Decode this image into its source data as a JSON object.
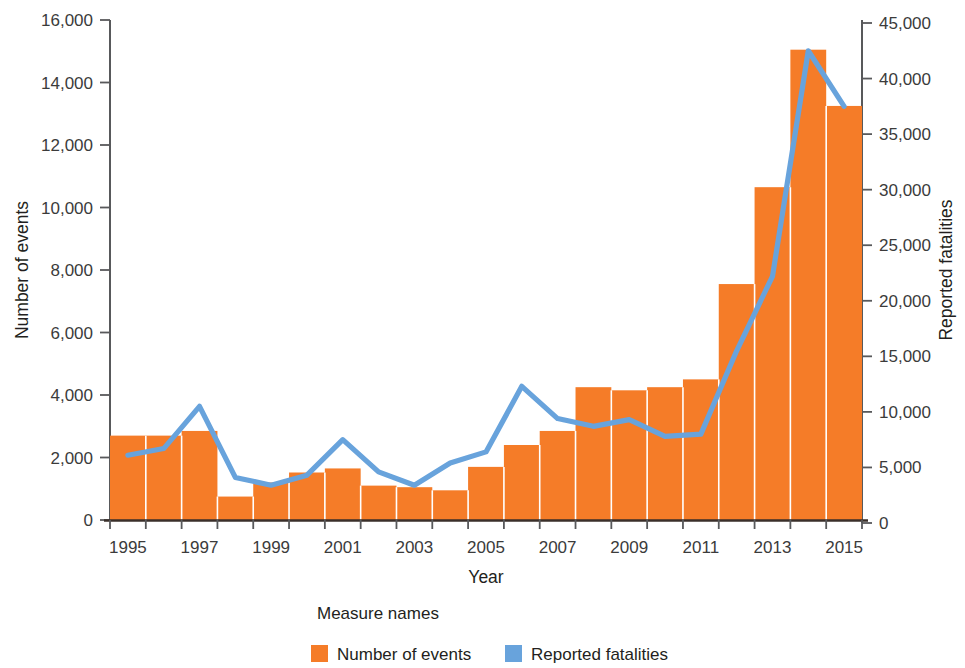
{
  "chart_data": {
    "type": "bar",
    "title": "",
    "subtitle": "",
    "xlabel": "Year",
    "ylabel": "Number of events",
    "y2label": "Reported fatalities",
    "categories": [
      "1995",
      "1996",
      "1997",
      "1998",
      "1999",
      "2000",
      "2001",
      "2002",
      "2003",
      "2004",
      "2005",
      "2006",
      "2007",
      "2008",
      "2009",
      "2010",
      "2011",
      "2012",
      "2013",
      "2014",
      "2015"
    ],
    "x_tick_labels": [
      "1995",
      "1997",
      "1999",
      "2001",
      "2003",
      "2005",
      "2007",
      "2009",
      "2011",
      "2013",
      "2015"
    ],
    "y_tick_labels": [
      "0",
      "2,000",
      "4,000",
      "6,000",
      "8,000",
      "10,000",
      "12,000",
      "14,000",
      "16,000"
    ],
    "y2_tick_labels": [
      "0",
      "5,000",
      "10,000",
      "15,000",
      "20,000",
      "25,000",
      "30,000",
      "35,000",
      "40,000",
      "45,000"
    ],
    "ylim": [
      0,
      16000
    ],
    "y2lim": [
      0,
      45000
    ],
    "grid": false,
    "legend_position": "bottom",
    "legend_title": "Measure names",
    "series": [
      {
        "name": "Number of events",
        "render": "bar",
        "axis": "left",
        "color": "#F57C28",
        "values": [
          2700,
          2700,
          2850,
          750,
          1200,
          1520,
          1650,
          1100,
          1050,
          950,
          1700,
          2400,
          2850,
          4250,
          4150,
          4250,
          4500,
          7550,
          10650,
          15050,
          13250
        ]
      },
      {
        "name": "Reported fatalities",
        "render": "line",
        "axis": "right",
        "color": "#68A3DC",
        "values": [
          6100,
          6700,
          10500,
          4100,
          3400,
          4300,
          7500,
          4600,
          3400,
          5400,
          6400,
          12300,
          9400,
          8700,
          9300,
          7800,
          8000,
          15500,
          22200,
          42500,
          37500
        ]
      }
    ]
  },
  "legend": {
    "title": "Measure names",
    "items": [
      {
        "label": "Number of events",
        "color": "#F57C28"
      },
      {
        "label": "Reported fatalities",
        "color": "#68A3DC"
      }
    ]
  },
  "axes": {
    "left_title": "Number of events",
    "right_title": "Reported fatalities",
    "bottom_title": "Year"
  }
}
